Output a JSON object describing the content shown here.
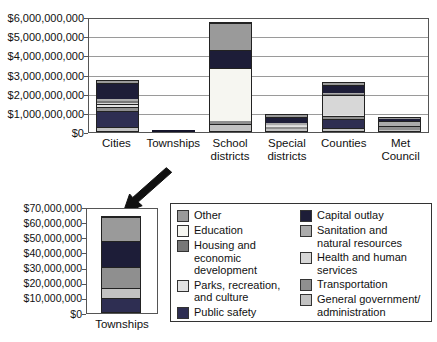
{
  "palette": {
    "Other": "#9a9a9a",
    "Education": "#f6f6f1",
    "Housing and economic development": "#787878",
    "Parks, recreation, and culture": "#e3e3e3",
    "Public safety": "#2e2e52",
    "Capital outlay": "#1d1d38",
    "Sanitation and natural resources": "#ababab",
    "Health and human services": "#d7d7d7",
    "Transportation": "#8f8f8f",
    "General government/administration": "#c2c2c2"
  },
  "chart_data": [
    {
      "id": "main",
      "type": "bar",
      "stacked": true,
      "categories": [
        "Cities",
        "Townships",
        "School\ndistricts",
        "Special\ndistricts",
        "Counties",
        "Met Council"
      ],
      "ylim": [
        0,
        6000000000
      ],
      "y_tick_step": 1000000000,
      "y_tick_labels_top_to_bottom": [
        "$6,000,000,000",
        "$5,000,000,000",
        "$4,000,000,000",
        "$3,000,000,000",
        "$2,000,000,000",
        "$1,000,000,000",
        "$0"
      ],
      "grid": true,
      "series_bottom_to_top": [
        {
          "name": "General government/administration",
          "values": [
            200000000,
            7000000,
            350000000,
            80000000,
            150000000,
            50000000
          ]
        },
        {
          "name": "Public safety",
          "values": [
            850000000,
            9000000,
            30000000,
            50000000,
            500000000,
            0
          ]
        },
        {
          "name": "Transportation",
          "values": [
            200000000,
            14000000,
            120000000,
            70000000,
            150000000,
            200000000
          ]
        },
        {
          "name": "Parks, recreation, and culture",
          "values": [
            150000000,
            0,
            0,
            50000000,
            50000000,
            0
          ]
        },
        {
          "name": "Health and human services",
          "values": [
            50000000,
            0,
            0,
            50000000,
            1050000000,
            0
          ]
        },
        {
          "name": "Housing and economic development",
          "values": [
            100000000,
            0,
            0,
            0,
            50000000,
            0
          ]
        },
        {
          "name": "Sanitation and natural resources",
          "values": [
            100000000,
            0,
            0,
            100000000,
            50000000,
            250000000
          ]
        },
        {
          "name": "Education",
          "values": [
            0,
            0,
            2800000000,
            0,
            0,
            0
          ]
        },
        {
          "name": "Capital outlay",
          "values": [
            850000000,
            17000000,
            950000000,
            350000000,
            400000000,
            120000000
          ]
        },
        {
          "name": "Other",
          "values": [
            100000000,
            16000000,
            1400000000,
            100000000,
            100000000,
            80000000
          ]
        }
      ],
      "bar_totals_approx": [
        2600000000,
        63000000,
        5650000000,
        850000000,
        2500000000,
        700000000
      ]
    },
    {
      "id": "townships-detail",
      "type": "bar",
      "stacked": true,
      "categories": [
        "Townships"
      ],
      "ylim": [
        0,
        70000000
      ],
      "y_tick_step": 10000000,
      "y_tick_labels_top_to_bottom": [
        "$70,000,000",
        "$60,000,000",
        "$50,000,000",
        "$40,000,000",
        "$30,000,000",
        "$20,000,000",
        "$10,000,000",
        "$0"
      ],
      "grid": false,
      "segments_bottom_to_top": [
        {
          "category": "Public safety",
          "value": 9000000
        },
        {
          "category": "General government/administration",
          "value": 7000000
        },
        {
          "category": "Transportation",
          "value": 14000000
        },
        {
          "category": "Capital outlay",
          "value": 17000000
        },
        {
          "category": "Other",
          "value": 16000000
        }
      ],
      "total_approx": 63000000
    }
  ],
  "legend": {
    "columns": [
      [
        {
          "label": "Other"
        },
        {
          "label": "Education"
        },
        {
          "label": "Housing and\neconomic development"
        },
        {
          "label": "Parks, recreation,\nand culture"
        },
        {
          "label": "Public safety"
        }
      ],
      [
        {
          "label": "Capital outlay"
        },
        {
          "label": "Sanitation and\nnatural resources"
        },
        {
          "label": "Health and human\nservices"
        },
        {
          "label": "Transportation"
        },
        {
          "label": "General government/\nadministration"
        }
      ]
    ]
  }
}
